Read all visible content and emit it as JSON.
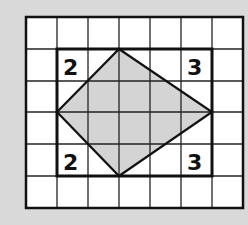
{
  "grid": {
    "cols": 7,
    "rows": 6,
    "x0": 26,
    "y0": 17,
    "cell_w": 31,
    "cell_h": 31.8
  },
  "inner_rect": {
    "col_start": 1,
    "col_end": 6,
    "row_start": 1,
    "row_end": 5
  },
  "corner_labels": {
    "top_left": "2",
    "top_right": "3",
    "bottom_left": "2",
    "bottom_right": "3"
  },
  "colors": {
    "background": "#d9d9d9",
    "grid_cell": "#ffffff",
    "line": "#111111",
    "shaded": "#cfcfcf"
  }
}
